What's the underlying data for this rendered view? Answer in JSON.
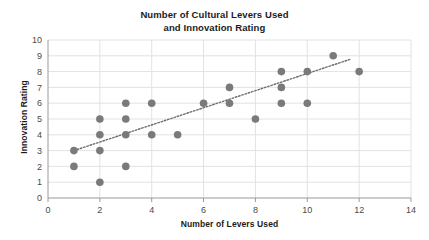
{
  "chart_data": {
    "type": "scatter",
    "title": "Number of Cultural Levers Used and Innovation Rating",
    "title_line1": "Number of Cultural Levers Used",
    "title_line2": "and Innovation Rating",
    "xlabel": "Number of Levers Used",
    "ylabel": "Innovation Rating",
    "xlim": [
      0,
      14
    ],
    "ylim": [
      0,
      10
    ],
    "xticks": [
      0,
      2,
      4,
      6,
      8,
      10,
      12,
      14
    ],
    "yticks": [
      0,
      1,
      2,
      3,
      4,
      5,
      6,
      7,
      8,
      9,
      10
    ],
    "xtick_labels": [
      "0",
      "2",
      "4",
      "6",
      "8",
      "10",
      "12",
      "14"
    ],
    "ytick_labels": [
      "0",
      "1",
      "2",
      "3",
      "4",
      "5",
      "6",
      "7",
      "8",
      "9",
      "10"
    ],
    "grid": true,
    "grid_axis": "both",
    "legend": false,
    "legend_position": "none",
    "marker": "circle",
    "marker_color": "#7a7a7a",
    "marker_size": 5,
    "grid_color": "#e2e2e2",
    "axis_color": "#9a9a9a",
    "background_color": "#ffffff",
    "points": [
      {
        "x": 1,
        "y": 3
      },
      {
        "x": 1,
        "y": 2
      },
      {
        "x": 2,
        "y": 5
      },
      {
        "x": 2,
        "y": 4
      },
      {
        "x": 2,
        "y": 3
      },
      {
        "x": 2,
        "y": 1
      },
      {
        "x": 3,
        "y": 6
      },
      {
        "x": 3,
        "y": 5
      },
      {
        "x": 3,
        "y": 4
      },
      {
        "x": 3,
        "y": 2
      },
      {
        "x": 4,
        "y": 6
      },
      {
        "x": 4,
        "y": 4
      },
      {
        "x": 5,
        "y": 4
      },
      {
        "x": 6,
        "y": 6
      },
      {
        "x": 7,
        "y": 7
      },
      {
        "x": 7,
        "y": 6
      },
      {
        "x": 8,
        "y": 5
      },
      {
        "x": 9,
        "y": 8
      },
      {
        "x": 9,
        "y": 7
      },
      {
        "x": 9,
        "y": 6
      },
      {
        "x": 10,
        "y": 8
      },
      {
        "x": 10,
        "y": 6
      },
      {
        "x": 11,
        "y": 9
      },
      {
        "x": 12,
        "y": 8
      }
    ],
    "trendline": {
      "type": "linear",
      "style": "dotted",
      "color": "#6e6e6e",
      "x_start": 1.0,
      "y_start": 3.0,
      "x_end": 11.7,
      "y_end": 8.8
    }
  }
}
